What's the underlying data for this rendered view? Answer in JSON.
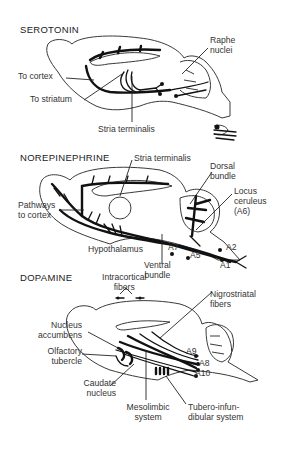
{
  "panels": [
    {
      "title": "SEROTONIN",
      "labels": {
        "raphe": "Raphe\nnuclei",
        "to_cortex": "To cortex",
        "to_striatum": "To striatum",
        "stria": "Stria terminalis"
      }
    },
    {
      "title": "NOREPINEPHRINE",
      "labels": {
        "stria": "Stria terminalis",
        "dorsal": "Dorsal\nbundle",
        "locus": "Locus\nceruleus\n(A6)",
        "pathways": "Pathways\nto cortex",
        "hypothalamus": "Hypothalamus",
        "a7": "A7",
        "a5": "A5",
        "a2": "A2",
        "a1": "A1",
        "ventral": "Ventral\nbundle"
      }
    },
    {
      "title": "DOPAMINE",
      "labels": {
        "intracortical": "Intracortical\nfibers",
        "nigrostriatal": "Nigrostriatal\nfibers",
        "nucleus_acc": "Nucleus\naccumbens",
        "olfactory": "Olfactory\ntubercle",
        "a9": "A9",
        "a8": "A8",
        "a10": "A10",
        "caudate": "Caudate\nnucleus",
        "mesolimbic": "Mesolimbic\nsystem",
        "tubero": "Tubero-infun-\ndibular system"
      }
    }
  ]
}
